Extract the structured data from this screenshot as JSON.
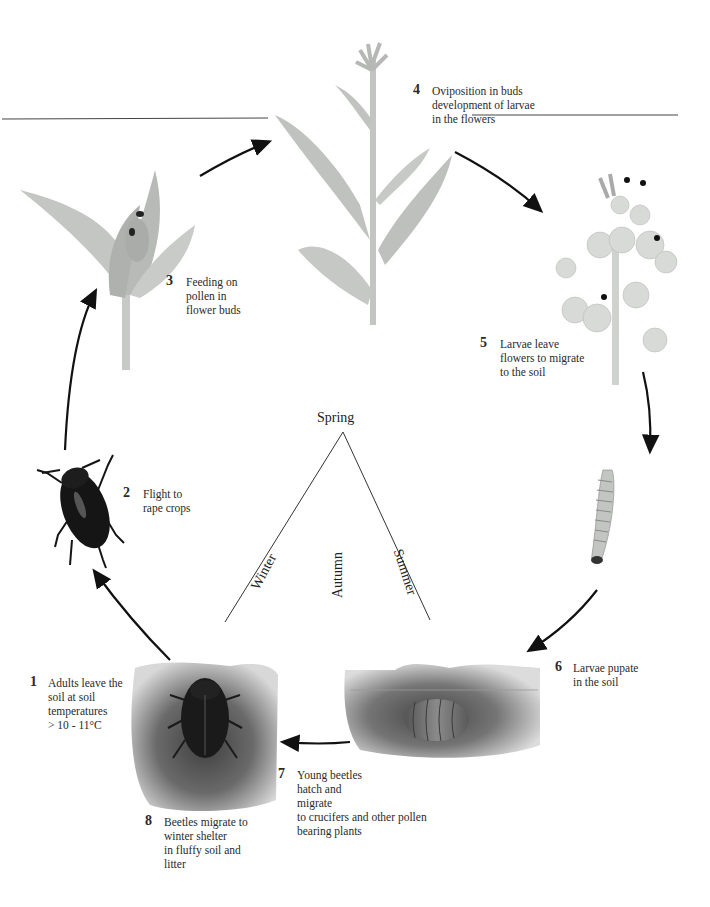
{
  "diagram": {
    "center": {
      "top_label": "Spring",
      "seasons": [
        "Winter",
        "Autumn",
        "Summer"
      ]
    },
    "stages": [
      {
        "number": "1",
        "text": "Adults leave the\nsoil at soil\ntemperatures\n> 10 - 11°C",
        "illustration": "beetle-in-soil"
      },
      {
        "number": "2",
        "text": "Flight to\nrape crops",
        "illustration": "flying-beetle"
      },
      {
        "number": "3",
        "text": "Feeding on\npollen in\nflower buds",
        "illustration": "flower-bud-with-beetles"
      },
      {
        "number": "4",
        "text": "Oviposition in buds\ndevelopment of larvae\nin the flowers",
        "illustration": "rape-plant"
      },
      {
        "number": "5",
        "text": "Larvae leave\nflowers to migrate\nto the soil",
        "illustration": "flowering-raceme"
      },
      {
        "number": "6",
        "text": "Larvae pupate\nin the soil",
        "illustration": "pupa-in-soil"
      },
      {
        "number": "7",
        "text": "Young beetles\nhatch and\nmigrate\nto crucifers and other pollen\nbearing plants",
        "illustration": "larva"
      },
      {
        "number": "8",
        "text": "Beetles migrate to\nwinter shelter\nin fluffy soil and\nlitter",
        "illustration": "beetle-in-soil"
      }
    ],
    "colors": {
      "arrow": "#111111",
      "plant": "#b9bdb9",
      "soil": "#6b6b6b",
      "beetle": "#151515"
    }
  }
}
